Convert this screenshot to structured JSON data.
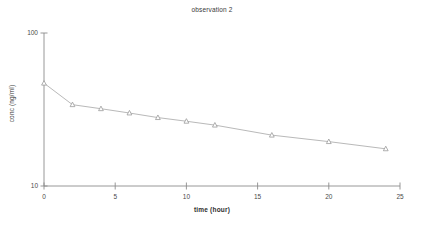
{
  "chart_data": {
    "type": "line",
    "title": "observation 2",
    "xlabel": "time (hour)",
    "ylabel": "conc (ng/ml)",
    "yscale": "log",
    "xlim": [
      0,
      25
    ],
    "ylim": [
      10,
      100
    ],
    "grid": false,
    "legend": null,
    "marker": "triangle",
    "line_color": "#b9b9b9",
    "marker_color": "#9a9a9a",
    "axis_color": "#8c8c8c",
    "x_ticks": [
      "0",
      "5",
      "10",
      "15",
      "20",
      "25"
    ],
    "x_tick_values": [
      0,
      5,
      10,
      15,
      20,
      25
    ],
    "y_ticks": [
      "10",
      "100"
    ],
    "y_tick_values": [
      10,
      100
    ],
    "series": [
      {
        "name": "observation 2",
        "x": [
          0,
          2,
          4,
          6,
          8,
          10,
          12,
          16,
          20,
          24
        ],
        "values": [
          47.0,
          34.0,
          32.0,
          30.0,
          28.0,
          26.5,
          25.0,
          21.5,
          19.5,
          17.5
        ]
      }
    ]
  }
}
